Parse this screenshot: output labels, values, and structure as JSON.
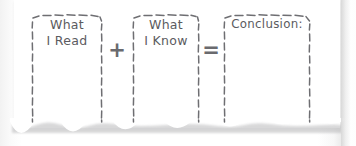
{
  "worksheet": {
    "title": "What I Read + What I Know = Conclusion",
    "ink_color": "#5b5b60",
    "paper_color": "#ffffff",
    "boxes": [
      {
        "id": "read",
        "label": "What\nI Read",
        "lines": [
          "What",
          "I Read"
        ]
      },
      {
        "id": "know",
        "label": "What\nI Know",
        "lines": [
          "What",
          "I Know"
        ]
      },
      {
        "id": "conclusion",
        "label": "Conclusion:",
        "lines": [
          "Conclusion:"
        ]
      }
    ],
    "operators": [
      {
        "id": "plus",
        "symbol": "+"
      },
      {
        "id": "equal",
        "symbol": "="
      }
    ]
  }
}
